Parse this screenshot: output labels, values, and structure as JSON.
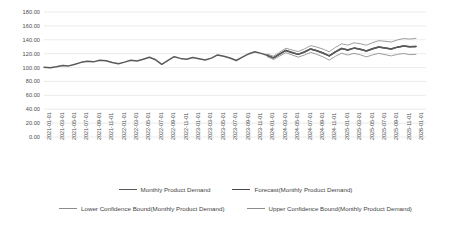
{
  "chart_data": {
    "type": "line",
    "title": "",
    "xlabel": "",
    "ylabel": "",
    "ylim": [
      0,
      180
    ],
    "ytick_step": 20,
    "grid": true,
    "legend_position": "bottom",
    "y_ticks": [
      "0.00",
      "20.00",
      "40.00",
      "60.00",
      "80.00",
      "100.00",
      "120.00",
      "140.00",
      "160.00",
      "180.00"
    ],
    "x_tick_labels": [
      "2021-01-01",
      "2021-03-01",
      "2021-05-01",
      "2021-07-01",
      "2021-09-01",
      "2021-11-01",
      "2022-01-01",
      "2022-03-01",
      "2022-05-01",
      "2022-07-01",
      "2022-09-01",
      "2022-11-01",
      "2023-01-01",
      "2023-03-01",
      "2023-05-01",
      "2023-07-01",
      "2023-09-01",
      "2023-11-01",
      "2024-01-01",
      "2024-03-01",
      "2024-05-01",
      "2024-07-01",
      "2024-09-01",
      "2024-11-01",
      "2025-01-01",
      "2025-03-01",
      "2025-05-01",
      "2025-07-01",
      "2025-09-01",
      "2025-11-01",
      "2026-01-01"
    ],
    "x": [
      "2021-01-01",
      "2021-02-01",
      "2021-03-01",
      "2021-04-01",
      "2021-05-01",
      "2021-06-01",
      "2021-07-01",
      "2021-08-01",
      "2021-09-01",
      "2021-10-01",
      "2021-11-01",
      "2021-12-01",
      "2022-01-01",
      "2022-02-01",
      "2022-03-01",
      "2022-04-01",
      "2022-05-01",
      "2022-06-01",
      "2022-07-01",
      "2022-08-01",
      "2022-09-01",
      "2022-10-01",
      "2022-11-01",
      "2022-12-01",
      "2023-01-01",
      "2023-02-01",
      "2023-03-01",
      "2023-04-01",
      "2023-05-01",
      "2023-06-01",
      "2023-07-01",
      "2023-08-01",
      "2023-09-01",
      "2023-10-01",
      "2023-11-01",
      "2023-12-01",
      "2024-01-01",
      "2024-02-01",
      "2024-03-01",
      "2024-04-01",
      "2024-05-01",
      "2024-06-01",
      "2024-07-01",
      "2024-08-01",
      "2024-09-01",
      "2024-10-01",
      "2024-11-01",
      "2024-12-01",
      "2025-01-01",
      "2025-02-01",
      "2025-03-01",
      "2025-04-01",
      "2025-05-01",
      "2025-06-01",
      "2025-07-01",
      "2025-08-01",
      "2025-09-01",
      "2025-10-01",
      "2025-11-01",
      "2025-12-01",
      "2026-01-01"
    ],
    "series": [
      {
        "name": "Monthly Product Demand",
        "color": "#595959",
        "values": [
          100.5,
          99.8,
          101.2,
          103.0,
          102.4,
          104.8,
          107.5,
          109.0,
          108.2,
          110.5,
          109.8,
          107.2,
          105.4,
          107.8,
          110.6,
          109.4,
          112.0,
          114.8,
          111.2,
          104.6,
          110.4,
          115.6,
          113.2,
          112.0,
          114.5,
          112.8,
          111.0,
          113.6,
          118.2,
          116.4,
          113.8,
          110.2,
          115.0,
          119.6,
          122.8,
          120.4,
          117.6,
          114.0,
          119.2,
          124.6,
          121.8,
          119.0,
          122.4,
          126.8,
          124.2,
          121.0,
          116.8,
          122.6,
          127.4,
          125.2,
          128.0,
          126.4,
          123.8,
          127.0,
          129.6,
          128.2,
          126.8,
          129.4,
          131.0,
          129.8,
          130.5
        ]
      },
      {
        "name": "Forecast(Monthly Product Demand)",
        "color": "#4a4a4a",
        "values": [
          null,
          null,
          null,
          null,
          null,
          null,
          null,
          null,
          null,
          null,
          null,
          null,
          null,
          null,
          null,
          null,
          null,
          null,
          null,
          null,
          null,
          null,
          null,
          null,
          null,
          null,
          null,
          null,
          null,
          null,
          null,
          null,
          null,
          null,
          null,
          null,
          117.6,
          114.0,
          119.2,
          124.6,
          121.8,
          119.0,
          122.4,
          126.8,
          124.2,
          121.0,
          116.8,
          122.6,
          127.4,
          125.2,
          128.0,
          126.4,
          123.8,
          127.0,
          129.6,
          128.2,
          126.8,
          129.4,
          131.0,
          129.8,
          130.5
        ]
      },
      {
        "name": "Lower Confidence Bound(Monthly Product Demand)",
        "color": "#8c8c8c",
        "values": [
          null,
          null,
          null,
          null,
          null,
          null,
          null,
          null,
          null,
          null,
          null,
          null,
          null,
          null,
          null,
          null,
          null,
          null,
          null,
          null,
          null,
          null,
          null,
          null,
          null,
          null,
          null,
          null,
          null,
          null,
          null,
          null,
          null,
          null,
          null,
          null,
          115.8,
          111.6,
          116.4,
          121.4,
          118.2,
          115.0,
          118.0,
          122.0,
          119.0,
          115.4,
          110.8,
          116.2,
          120.6,
          118.0,
          120.4,
          118.4,
          115.4,
          118.2,
          120.4,
          118.6,
          116.8,
          119.0,
          120.2,
          118.6,
          119.0
        ]
      },
      {
        "name": "Upper Confidence Bound(Monthly Product Demand)",
        "color": "#8c8c8c",
        "values": [
          null,
          null,
          null,
          null,
          null,
          null,
          null,
          null,
          null,
          null,
          null,
          null,
          null,
          null,
          null,
          null,
          null,
          null,
          null,
          null,
          null,
          null,
          null,
          null,
          null,
          null,
          null,
          null,
          null,
          null,
          null,
          null,
          null,
          null,
          null,
          null,
          119.4,
          116.4,
          122.0,
          127.8,
          125.4,
          123.0,
          126.8,
          131.6,
          129.4,
          126.6,
          122.8,
          129.0,
          134.2,
          132.4,
          135.6,
          134.4,
          132.2,
          135.8,
          138.8,
          137.8,
          136.8,
          139.8,
          141.8,
          141.0,
          142.0
        ]
      }
    ],
    "legend": [
      {
        "label": "Monthly Product Demand",
        "color": "#595959",
        "width": 1.6
      },
      {
        "label": "Forecast(Monthly Product Demand)",
        "color": "#4a4a4a",
        "width": 1.6
      },
      {
        "label": "Lower Confidence Bound(Monthly Product Demand)",
        "color": "#8c8c8c",
        "width": 1.0
      },
      {
        "label": "Upper Confidence Bound(Monthly Product Demand)",
        "color": "#8c8c8c",
        "width": 1.0
      }
    ],
    "colors": {
      "background": "#ffffff",
      "gridline": "#e2e2e2",
      "tick_text": "#4a4a4a",
      "history_line": "#595959",
      "forecast_line": "#4a4a4a",
      "bound_line": "#8c8c8c"
    }
  }
}
